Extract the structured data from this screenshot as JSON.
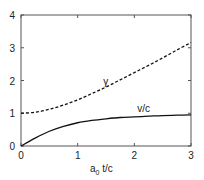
{
  "chart_data": {
    "type": "line",
    "title": "",
    "xlabel": "a0 t/c",
    "xlabel_main": "a",
    "xlabel_sub": "0",
    "xlabel_rest": " t/c",
    "ylabel": "",
    "xlim": [
      0,
      3
    ],
    "ylim": [
      0,
      4
    ],
    "xticks": [
      "0",
      "1",
      "2",
      "3"
    ],
    "yticks": [
      "0",
      "1",
      "2",
      "3",
      "4"
    ],
    "grid": false,
    "legend": "none (inline annotations)",
    "x": [
      0,
      0.25,
      0.5,
      0.75,
      1.0,
      1.25,
      1.5,
      1.75,
      2.0,
      2.25,
      2.5,
      2.75,
      3.0
    ],
    "series": [
      {
        "name": "γ",
        "style": "dashed",
        "values": [
          1.0,
          1.03,
          1.12,
          1.25,
          1.41,
          1.6,
          1.8,
          2.02,
          2.24,
          2.46,
          2.69,
          2.93,
          3.16
        ]
      },
      {
        "name": "v/c",
        "style": "solid",
        "values": [
          0.0,
          0.24,
          0.45,
          0.6,
          0.71,
          0.78,
          0.83,
          0.87,
          0.89,
          0.91,
          0.93,
          0.94,
          0.95
        ]
      }
    ],
    "annotations": [
      {
        "text": "γ",
        "x": 1.45,
        "y": 1.85
      },
      {
        "text": "v/c",
        "x": 2.05,
        "y": 1.05
      }
    ]
  }
}
